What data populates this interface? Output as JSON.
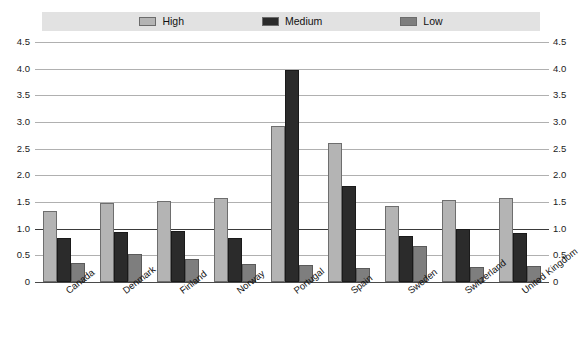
{
  "chart_data": {
    "type": "bar",
    "title": "",
    "subtitle": "",
    "xlabel": "",
    "ylabel": "",
    "ylim": [
      0,
      4.5
    ],
    "grid": true,
    "legend_position": "top",
    "ytick_labels": [
      "4.5",
      "4.0",
      "3.5",
      "3.0",
      "2.5",
      "2.0",
      "1.5",
      "1.0",
      "0.5",
      "0"
    ],
    "ytick_values": [
      4.5,
      4.0,
      3.5,
      3.0,
      2.5,
      2.0,
      1.5,
      1.0,
      0.5,
      0
    ],
    "dual_axis": true,
    "categories": [
      "Canada",
      "Denmark",
      "Finland",
      "Norway",
      "Portugal",
      "Spain",
      "Sweden",
      "Switzerland",
      "United Kingdom"
    ],
    "series": [
      {
        "name": "High",
        "color": "#b4b4b4",
        "values": [
          1.33,
          1.48,
          1.52,
          1.58,
          2.92,
          2.6,
          1.43,
          1.54,
          1.58
        ]
      },
      {
        "name": "Medium",
        "color": "#2b2b2b",
        "values": [
          0.83,
          0.93,
          0.96,
          0.82,
          3.98,
          1.8,
          0.87,
          1.0,
          0.92
        ]
      },
      {
        "name": "Low",
        "color": "#7e7e7e",
        "values": [
          0.35,
          0.53,
          0.43,
          0.34,
          0.32,
          0.26,
          0.67,
          0.28,
          0.3
        ]
      }
    ]
  },
  "legend": {
    "background_color": "#e2e2e2",
    "items": [
      {
        "label": "High",
        "swatch_color": "#b4b4b4",
        "icon": "legend-swatch-icon"
      },
      {
        "label": "Medium",
        "swatch_color": "#2b2b2b",
        "icon": "legend-swatch-icon"
      },
      {
        "label": "Low",
        "swatch_color": "#7e7e7e",
        "icon": "legend-swatch-icon"
      }
    ]
  }
}
